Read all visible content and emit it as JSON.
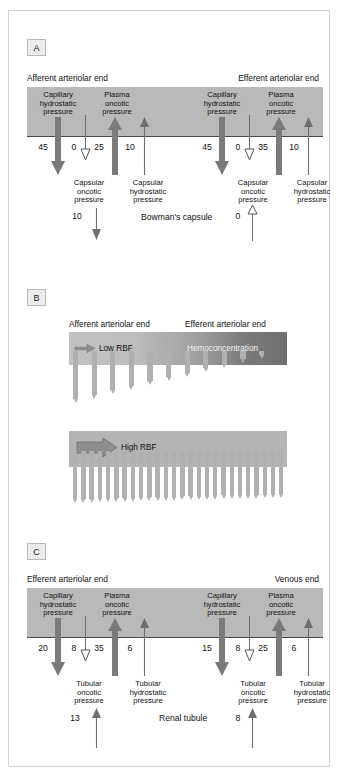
{
  "figure": {
    "panels": [
      {
        "tag": "A",
        "title_left": "Afferent arteriolar end",
        "title_right": "Efferent arteriolar end",
        "compartment_label": "Bowman's capsule",
        "sides": [
          {
            "id": "afferent",
            "forces": [
              {
                "name": "Capillary hydrostatic pressure",
                "line1": "Capillary",
                "line2": "hydrostatic",
                "line3": "pressure",
                "value": "45",
                "direction": "down",
                "style": "thick"
              },
              {
                "name": "Capsular oncotic pressure",
                "line1": "Capsular",
                "line2": "oncotic",
                "line3": "pressure",
                "value": "0",
                "direction": "down",
                "style": "outline"
              },
              {
                "name": "Plasma oncotic pressure",
                "line1": "Plasma",
                "line2": "oncotic",
                "line3": "pressure",
                "value": "25",
                "direction": "up",
                "style": "thick"
              },
              {
                "name": "Capsular hydrostatic pressure",
                "line1": "Capsular",
                "line2": "hydrostatic",
                "line3": "pressure",
                "value": "10",
                "direction": "up",
                "style": "thin"
              }
            ],
            "net": {
              "value": "10",
              "direction": "down",
              "style": "thin"
            }
          },
          {
            "id": "efferent",
            "forces": [
              {
                "name": "Capillary hydrostatic pressure",
                "line1": "Capillary",
                "line2": "hydrostatic",
                "line3": "pressure",
                "value": "45",
                "direction": "down",
                "style": "thick"
              },
              {
                "name": "Capsular oncotic pressure",
                "line1": "Capsular",
                "line2": "oncotic",
                "line3": "pressure",
                "value": "0",
                "direction": "down",
                "style": "outline"
              },
              {
                "name": "Plasma oncotic pressure",
                "line1": "Plasma",
                "line2": "oncotic",
                "line3": "pressure",
                "value": "35",
                "direction": "up",
                "style": "thick"
              },
              {
                "name": "Capsular hydrostatic pressure",
                "line1": "Capsular",
                "line2": "hydrostatic",
                "line3": "pressure",
                "value": "10",
                "direction": "up",
                "style": "thin"
              }
            ],
            "net": {
              "value": "0",
              "direction": "up",
              "style": "outline"
            }
          }
        ]
      },
      {
        "tag": "B",
        "title_left": "Afferent arteriolar end",
        "title_right": "Efferent arteriolar end",
        "bars": [
          {
            "id": "low-rbf",
            "flow_label": "Low RBF",
            "end_label": "Hemoconcentration",
            "arrow_style": "small",
            "filtration_arrows": 11,
            "taper": true
          },
          {
            "id": "high-rbf",
            "flow_label": "High RBF",
            "end_label": "",
            "arrow_style": "large",
            "filtration_arrows": 26,
            "taper": false
          }
        ]
      },
      {
        "tag": "C",
        "title_left": "Efferent arteriolar end",
        "title_right": "Venous end",
        "compartment_label": "Renal tubule",
        "sides": [
          {
            "id": "efferent-end",
            "forces": [
              {
                "name": "Capillary hydrostatic pressure",
                "line1": "Capillary",
                "line2": "hydrostatic",
                "line3": "pressure",
                "value": "20",
                "direction": "down",
                "style": "thick"
              },
              {
                "name": "Tubular oncotic pressure",
                "line1": "Tubular",
                "line2": "oncotic",
                "line3": "pressure",
                "value": "8",
                "direction": "down",
                "style": "outline"
              },
              {
                "name": "Plasma oncotic pressure",
                "line1": "Plasma",
                "line2": "oncotic",
                "line3": "pressure",
                "value": "35",
                "direction": "up",
                "style": "thick"
              },
              {
                "name": "Tubular hydrostatic pressure",
                "line1": "Tubular",
                "line2": "hydrostatic",
                "line3": "pressure",
                "value": "6",
                "direction": "up",
                "style": "thin"
              }
            ],
            "net": {
              "value": "13",
              "direction": "up",
              "style": "thin"
            }
          },
          {
            "id": "venous-end",
            "forces": [
              {
                "name": "Capillary hydrostatic pressure",
                "line1": "Capillary",
                "line2": "hydrostatic",
                "line3": "pressure",
                "value": "15",
                "direction": "down",
                "style": "thick"
              },
              {
                "name": "Tubular oncotic pressure",
                "line1": "Tubular",
                "line2": "oncotic",
                "line3": "pressure",
                "value": "8",
                "direction": "down",
                "style": "outline"
              },
              {
                "name": "Plasma oncotic pressure",
                "line1": "Plasma",
                "line2": "oncotic",
                "line3": "pressure",
                "value": "25",
                "direction": "up",
                "style": "thick"
              },
              {
                "name": "Tubular hydrostatic pressure",
                "line1": "Tubular",
                "line2": "hydrostatic",
                "line3": "pressure",
                "value": "6",
                "direction": "up",
                "style": "thin"
              }
            ],
            "net": {
              "value": "8",
              "direction": "up",
              "style": "thin"
            }
          }
        ]
      }
    ],
    "colors": {
      "bar": "#b9b9b9",
      "thick_arrow": "#7a7a7a",
      "thin_arrow": "#6f6f6f",
      "outline_arrow": "#ffffff",
      "border": "#d2d2d2"
    }
  }
}
